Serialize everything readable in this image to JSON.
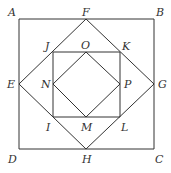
{
  "diagram": {
    "stroke_color": "#333333",
    "points": {
      "A": {
        "label": "A",
        "x": 19,
        "y": 19
      },
      "B": {
        "label": "B",
        "x": 154,
        "y": 19
      },
      "C": {
        "label": "C",
        "x": 154,
        "y": 149
      },
      "D": {
        "label": "D",
        "x": 19,
        "y": 149
      },
      "E": {
        "label": "E",
        "x": 19,
        "y": 84
      },
      "F": {
        "label": "F",
        "x": 86,
        "y": 19
      },
      "G": {
        "label": "G",
        "x": 154,
        "y": 84
      },
      "H": {
        "label": "H",
        "x": 86,
        "y": 149
      },
      "I": {
        "label": "I",
        "x": 53,
        "y": 117
      },
      "J": {
        "label": "J",
        "x": 53,
        "y": 52
      },
      "K": {
        "label": "K",
        "x": 120,
        "y": 52
      },
      "L": {
        "label": "L",
        "x": 120,
        "y": 117
      },
      "M": {
        "label": "M",
        "x": 86,
        "y": 117
      },
      "N": {
        "label": "N",
        "x": 53,
        "y": 84
      },
      "O": {
        "label": "O",
        "x": 86,
        "y": 52
      },
      "P": {
        "label": "P",
        "x": 120,
        "y": 84
      }
    },
    "shapes": [
      {
        "name": "square-ABCD",
        "vertices": [
          "A",
          "B",
          "C",
          "D"
        ]
      },
      {
        "name": "square-EFGH",
        "vertices": [
          "E",
          "F",
          "G",
          "H"
        ]
      },
      {
        "name": "square-IJKL",
        "vertices": [
          "J",
          "K",
          "L",
          "I"
        ]
      },
      {
        "name": "square-MNOP",
        "vertices": [
          "N",
          "O",
          "P",
          "M"
        ]
      }
    ]
  }
}
